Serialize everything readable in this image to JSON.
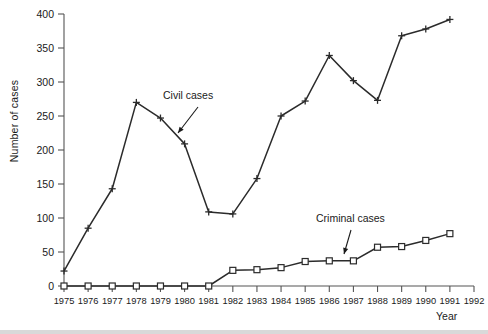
{
  "chart_data": {
    "type": "line",
    "title": "",
    "xlabel": "Year",
    "ylabel": "Number of cases",
    "xlim": [
      1975,
      1992
    ],
    "ylim": [
      0,
      400
    ],
    "grid": false,
    "legend_position": "inline-annotations",
    "x": [
      1975,
      1976,
      1977,
      1978,
      1979,
      1980,
      1981,
      1982,
      1983,
      1984,
      1985,
      1986,
      1987,
      1988,
      1989,
      1990,
      1991
    ],
    "xticks": [
      "1975",
      "1976",
      "1977",
      "1978",
      "1979",
      "1980",
      "1981",
      "1982",
      "1983",
      "1984",
      "1985",
      "1986",
      "1987",
      "1988",
      "1989",
      "1990",
      "1991",
      "1992"
    ],
    "xtick_values": [
      1975,
      1976,
      1977,
      1978,
      1979,
      1980,
      1981,
      1982,
      1983,
      1984,
      1985,
      1986,
      1987,
      1988,
      1989,
      1990,
      1991,
      1992
    ],
    "yticks": [
      "0",
      "50",
      "100",
      "150",
      "200",
      "250",
      "300",
      "350",
      "400"
    ],
    "ytick_values": [
      0,
      50,
      100,
      150,
      200,
      250,
      300,
      350,
      400
    ],
    "series": [
      {
        "name": "Civil cases",
        "marker": "plus",
        "color": "#2b2b2b",
        "values": [
          22,
          85,
          143,
          270,
          247,
          209,
          109,
          106,
          158,
          250,
          272,
          339,
          302,
          273,
          368,
          378,
          392
        ]
      },
      {
        "name": "Criminal cases",
        "marker": "square",
        "color": "#2b2b2b",
        "values": [
          0,
          0,
          0,
          0,
          0,
          0,
          0,
          23,
          24,
          27,
          36,
          37,
          37,
          57,
          58,
          67,
          77
        ]
      }
    ],
    "annotations": [
      {
        "text": "Civil cases",
        "label_x": 163,
        "label_y": 99,
        "arrow_from_x": 198,
        "arrow_from_y": 107,
        "arrow_to_x": 178,
        "arrow_to_y": 133
      },
      {
        "text": "Criminal cases",
        "label_x": 316,
        "label_y": 222,
        "arrow_from_x": 351,
        "arrow_from_y": 230,
        "arrow_to_x": 344,
        "arrow_to_y": 254
      }
    ]
  }
}
